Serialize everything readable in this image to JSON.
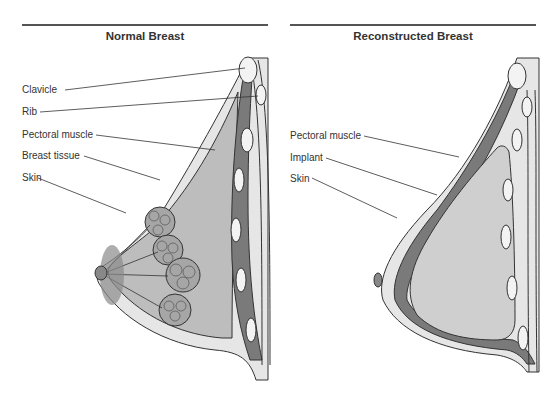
{
  "figure": {
    "panels": [
      {
        "title": "Normal Breast",
        "labels": [
          "Clavicle",
          "Rib",
          "Pectoral muscle",
          "Breast tissue",
          "Skin"
        ]
      },
      {
        "title": "Reconstructed Breast",
        "labels": [
          "Pectoral muscle",
          "Implant",
          "Skin"
        ]
      }
    ]
  },
  "colors": {
    "muscle": "#7a7a7a",
    "tissue": "#b8b8b8",
    "implant": "#cfcfcf",
    "skin": "#e6e6e6",
    "line": "#333333"
  }
}
